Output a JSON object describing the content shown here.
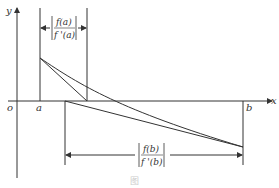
{
  "diagram": {
    "axes": {
      "y_label": "y",
      "x_label": "x",
      "origin_label": "o",
      "a_label": "a",
      "b_label": "b"
    },
    "annotations": {
      "top": {
        "numerator": "f(a)",
        "denominator": "f '(a)"
      },
      "bottom": {
        "numerator": "f(b)",
        "denominator": "f '(b)"
      }
    },
    "caption": "图"
  }
}
